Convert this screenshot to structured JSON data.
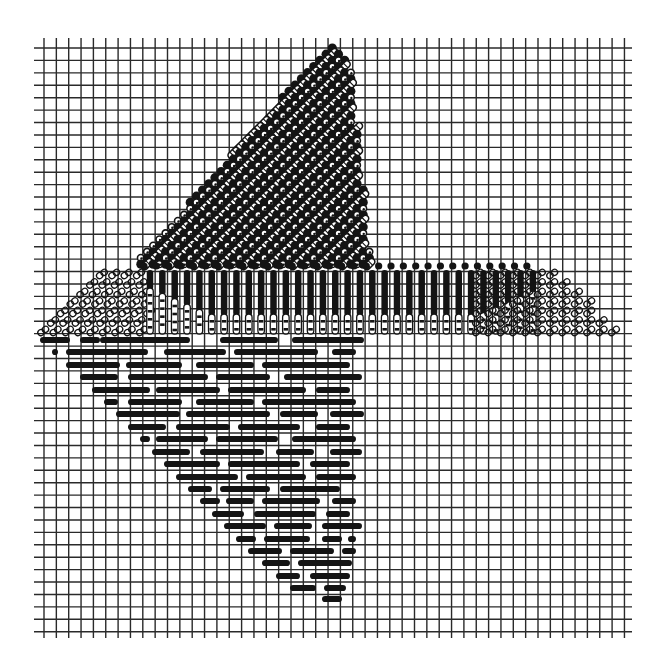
{
  "canvas": {
    "width": 666,
    "height": 667,
    "background": "#ffffff"
  },
  "colors": {
    "ink": "#141414",
    "grid": "#2a2a2a",
    "paper": "#ffffff"
  },
  "grid": {
    "x0": 44.0,
    "dx": 12.35,
    "cols": 48,
    "y0": 48.0,
    "dy": 12.42,
    "rows": 48,
    "h_line_x_start": 34,
    "h_line_x_end": 632,
    "v_line_y_start": 38,
    "v_line_y_end": 638,
    "line_width": 1.4
  },
  "upper_triangle": {
    "pattern": "dot-and-hatched-lattice",
    "apex": [
      330,
      44
    ],
    "bottom_left": [
      128,
      272
    ],
    "bottom_right": [
      372,
      272
    ],
    "right_edge_top": [
      350,
      60
    ],
    "dot_radius": 4.6,
    "cell": 12.35
  },
  "middle_band": {
    "pattern": "chain-links-and-vertical-bars",
    "y_top": 268,
    "y_bottom": 336,
    "left_links": {
      "x_start": 38,
      "x_end": 150,
      "slope_top_x": 108
    },
    "right_links": {
      "x_start": 478,
      "x_end": 630,
      "slope_top_x": 548
    },
    "bars": {
      "x_start": 150,
      "x_end": 540,
      "pitch": 12.35,
      "width": 6.5
    }
  },
  "lower_triangle": {
    "pattern": "horizontal-float-bars",
    "top_y": 340,
    "row_pitch": 12.42,
    "rows": [
      {
        "y": 340,
        "segments": [
          [
            40,
            70
          ],
          [
            80,
            100
          ],
          [
            100,
            190
          ],
          [
            220,
            278
          ],
          [
            292,
            364
          ]
        ]
      },
      {
        "y": 352,
        "segments": [
          [
            52,
            58
          ],
          [
            66,
            148
          ],
          [
            164,
            226
          ],
          [
            234,
            318
          ],
          [
            332,
            356
          ]
        ]
      },
      {
        "y": 365,
        "segments": [
          [
            66,
            120
          ],
          [
            126,
            182
          ],
          [
            196,
            254
          ],
          [
            262,
            350
          ]
        ]
      },
      {
        "y": 377,
        "segments": [
          [
            80,
            118
          ],
          [
            128,
            208
          ],
          [
            216,
            270
          ],
          [
            284,
            362
          ]
        ]
      },
      {
        "y": 390,
        "segments": [
          [
            92,
            150
          ],
          [
            156,
            220
          ],
          [
            228,
            306
          ],
          [
            316,
            350
          ]
        ]
      },
      {
        "y": 402,
        "segments": [
          [
            104,
            118
          ],
          [
            128,
            182
          ],
          [
            196,
            254
          ],
          [
            262,
            356
          ]
        ]
      },
      {
        "y": 414,
        "segments": [
          [
            116,
            180
          ],
          [
            186,
            270
          ],
          [
            280,
            318
          ],
          [
            330,
            364
          ]
        ]
      },
      {
        "y": 427,
        "segments": [
          [
            128,
            166
          ],
          [
            176,
            230
          ],
          [
            238,
            300
          ],
          [
            316,
            350
          ]
        ]
      },
      {
        "y": 439,
        "segments": [
          [
            140,
            150
          ],
          [
            156,
            208
          ],
          [
            216,
            278
          ],
          [
            292,
            356
          ]
        ]
      },
      {
        "y": 452,
        "segments": [
          [
            152,
            190
          ],
          [
            200,
            264
          ],
          [
            276,
            314
          ],
          [
            330,
            362
          ]
        ]
      },
      {
        "y": 464,
        "segments": [
          [
            164,
            220
          ],
          [
            228,
            300
          ],
          [
            310,
            350
          ]
        ]
      },
      {
        "y": 477,
        "segments": [
          [
            176,
            238
          ],
          [
            246,
            306
          ],
          [
            316,
            356
          ]
        ]
      },
      {
        "y": 489,
        "segments": [
          [
            188,
            212
          ],
          [
            220,
            270
          ],
          [
            280,
            340
          ]
        ]
      },
      {
        "y": 501,
        "segments": [
          [
            200,
            220
          ],
          [
            226,
            254
          ],
          [
            262,
            320
          ],
          [
            332,
            356
          ]
        ]
      },
      {
        "y": 514,
        "segments": [
          [
            212,
            244
          ],
          [
            254,
            316
          ],
          [
            326,
            350
          ]
        ]
      },
      {
        "y": 526,
        "segments": [
          [
            224,
            266
          ],
          [
            274,
            312
          ],
          [
            322,
            362
          ]
        ]
      },
      {
        "y": 539,
        "segments": [
          [
            236,
            256
          ],
          [
            264,
            310
          ],
          [
            322,
            342
          ],
          [
            348,
            356
          ]
        ]
      },
      {
        "y": 551,
        "segments": [
          [
            248,
            282
          ],
          [
            290,
            334
          ],
          [
            342,
            356
          ]
        ]
      },
      {
        "y": 563,
        "segments": [
          [
            262,
            290
          ],
          [
            298,
            352
          ]
        ]
      },
      {
        "y": 576,
        "segments": [
          [
            276,
            300
          ],
          [
            310,
            350
          ]
        ]
      },
      {
        "y": 588,
        "segments": [
          [
            290,
            316
          ],
          [
            324,
            346
          ]
        ]
      },
      {
        "y": 599,
        "segments": [
          [
            322,
            342
          ]
        ]
      }
    ],
    "bar_height": 6.2
  },
  "labels": {
    "title": ""
  }
}
